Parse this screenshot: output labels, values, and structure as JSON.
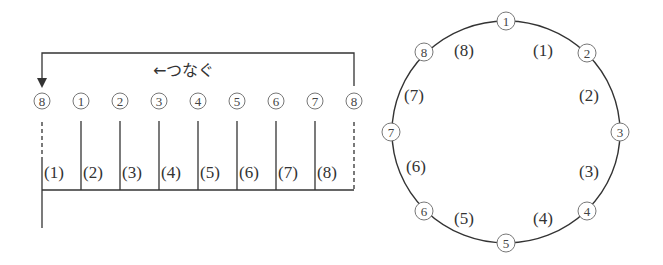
{
  "left_diagram": {
    "arrow_label": "←つなぐ",
    "top_nodes": [
      "8",
      "1",
      "2",
      "3",
      "4",
      "5",
      "6",
      "7",
      "8"
    ],
    "segment_labels": [
      "(1)",
      "(2)",
      "(3)",
      "(4)",
      "(5)",
      "(6)",
      "(7)",
      "(8)"
    ]
  },
  "circle_diagram": {
    "nodes": [
      "1",
      "2",
      "3",
      "4",
      "5",
      "6",
      "7",
      "8"
    ],
    "arc_labels": [
      "(1)",
      "(2)",
      "(3)",
      "(4)",
      "(5)",
      "(6)",
      "(7)",
      "(8)"
    ]
  },
  "colors": {
    "line": "#333333",
    "node_stroke": "#777777",
    "background": "#ffffff"
  }
}
